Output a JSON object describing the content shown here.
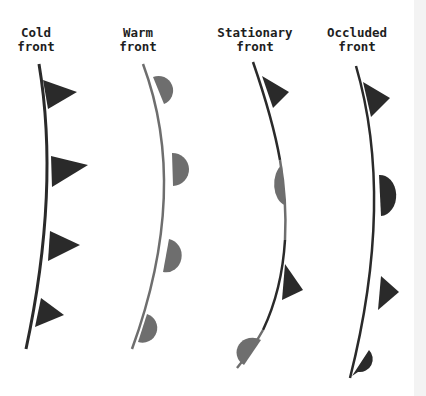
{
  "colors": {
    "dark": "#2a2a2a",
    "gray": "#6e6e6e",
    "background": "#ffffff",
    "edge_strip": "#f3f3f3"
  },
  "fronts": [
    {
      "id": "cold",
      "label_line1": "Cold",
      "label_line2": "front",
      "symbols": [
        "triangle",
        "triangle",
        "triangle",
        "triangle"
      ],
      "line_color": "#2a2a2a",
      "symbol_color": "#2a2a2a"
    },
    {
      "id": "warm",
      "label_line1": "Warm",
      "label_line2": "front",
      "symbols": [
        "semicircle",
        "semicircle",
        "semicircle",
        "semicircle"
      ],
      "line_color": "#6e6e6e",
      "symbol_color": "#6e6e6e"
    },
    {
      "id": "stationary",
      "label_line1": "Stationary",
      "label_line2": "front",
      "symbols": [
        "triangle",
        "semicircle",
        "triangle",
        "semicircle"
      ],
      "line_color": "alternating #2a2a2a / #6e6e6e",
      "symbol_color": "triangles #2a2a2a on right, semicircles #6e6e6e on left"
    },
    {
      "id": "occluded",
      "label_line1": "Occluded",
      "label_line2": "front",
      "symbols": [
        "triangle",
        "semicircle",
        "triangle",
        "semicircle"
      ],
      "line_color": "#2a2a2a",
      "symbol_color": "#2a2a2a"
    }
  ]
}
